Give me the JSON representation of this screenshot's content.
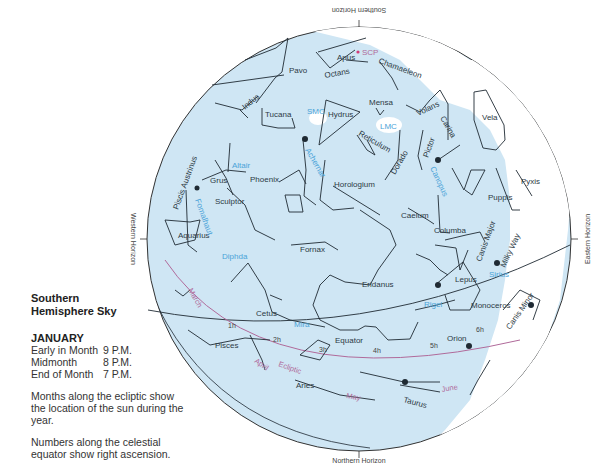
{
  "legend": {
    "title_line1": "Southern",
    "title_line2": "Hemisphere Sky",
    "month": "JANUARY",
    "times": [
      {
        "label": "Early in Month",
        "time": "9 P.M."
      },
      {
        "label": "Midmonth",
        "time": "8 P.M."
      },
      {
        "label": "End of Month",
        "time": "7 P.M."
      }
    ],
    "note_ecliptic": "Months along the ecliptic show the location of the sun during the year.",
    "note_equator": "Numbers along the celestial equator show right ascension."
  },
  "horizons": {
    "south": "Southern Horizon",
    "north": "Northern Horizon",
    "east": "Eastern Horizon",
    "west": "Western Horizon"
  },
  "colors": {
    "sky": "#cfe6f4",
    "milky_way": "#ffffff",
    "star_label": "#4aa3d8",
    "ecliptic": "#b06a9a",
    "lines": "#1f2a33"
  },
  "constellations": {
    "apus": "Apus",
    "pavo": "Pavo",
    "octans": "Octans",
    "chamaeleon": "Chamaeleon",
    "indus": "Indus",
    "tucana": "Tucana",
    "hydrus": "Hydrus",
    "mensa": "Mensa",
    "volans": "Volans",
    "carina": "Carina",
    "vela": "Vela",
    "grus": "Grus",
    "reticulum": "Reticulum",
    "dorado": "Dorado",
    "pictor": "Pictor",
    "phoenix": "Phoenix",
    "horologium": "Horologium",
    "piscis_austrinus": "Piscis Austrinus",
    "sculptor": "Sculptor",
    "caelum": "Caelum",
    "puppis": "Puppis",
    "pyxis": "Pyxis",
    "columba": "Columba",
    "canis_major": "Canis Major",
    "aquarius": "Aquarius",
    "fornax": "Fornax",
    "lepus": "Lepus",
    "eridanus": "Eridanus",
    "monoceros": "Monoceros",
    "cetus": "Cetus",
    "orion": "Orion",
    "canis_minor": "Canis Minor",
    "pisces": "Pisces",
    "aries": "Aries",
    "taurus": "Taurus"
  },
  "stars": {
    "scp": "SCP",
    "smc": "SMC",
    "lmc": "LMC",
    "altair": "Altair",
    "achernar": "Achernar",
    "canopus": "Canopus",
    "fomalhaut": "Fomalhaut",
    "diphda": "Diphda",
    "sirius": "Sirius",
    "rigel": "Rigel",
    "mira": "Mira"
  },
  "lines": {
    "equator": "Equator",
    "ecliptic": "Ecliptic",
    "milky_way": "Milky Way"
  },
  "ecliptic_months": [
    "March",
    "April",
    "May",
    "June"
  ],
  "right_ascension": [
    "1h",
    "2h",
    "3h",
    "4h",
    "5h",
    "6h"
  ]
}
